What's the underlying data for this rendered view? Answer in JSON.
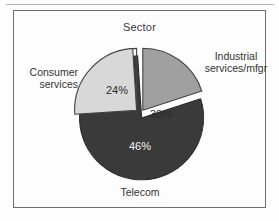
{
  "figure": {
    "title": "Sector",
    "background_color": "#fdfdfd",
    "frame_color": "#6e6e6e"
  },
  "chart_data": {
    "type": "pie",
    "title": "Sector",
    "xlabel": "",
    "ylabel": "",
    "units": "percent",
    "exploded": true,
    "start_angle_deg": 0,
    "direction": "clockwise",
    "legend": "none (direct slice labels)",
    "categories": [
      "Industrial services/mfgr",
      "Telecom",
      "Consumer services"
    ],
    "values": [
      30,
      46,
      24
    ],
    "value_labels": [
      "30%",
      "46%",
      "24%"
    ],
    "colors": [
      "#a0a0a0",
      "#3a3a3a",
      "#d8d8d8"
    ],
    "slices": [
      {
        "name": "Industrial services/mfgr",
        "label": "Industrial\nservices/mfgr",
        "value": 30,
        "value_label": "30%",
        "color": "#a0a0a0",
        "label_position": "right"
      },
      {
        "name": "Telecom",
        "label": "Telecom",
        "value": 46,
        "value_label": "46%",
        "color": "#3a3a3a",
        "label_position": "bottom"
      },
      {
        "name": "Consumer services",
        "label": "Consumer\nservices",
        "value": 24,
        "value_label": "24%",
        "color": "#d8d8d8",
        "label_position": "left"
      }
    ]
  }
}
